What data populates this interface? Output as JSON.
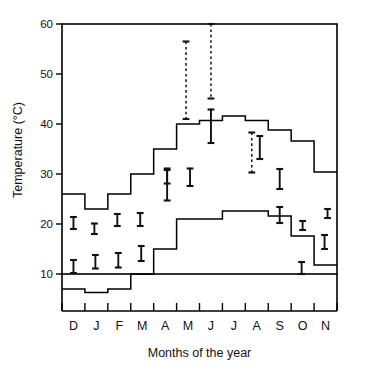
{
  "chart_data": {
    "type": "line",
    "title": "",
    "xlabel": "Months of the year",
    "ylabel": "Temperature (°C)",
    "xlim": [
      0,
      12
    ],
    "ylim": [
      0,
      60
    ],
    "ytick_values": [
      10,
      20,
      30,
      40,
      50,
      60
    ],
    "ytick_labels": [
      "10",
      "20",
      "30",
      "40",
      "50",
      "60"
    ],
    "categories": [
      "D",
      "J",
      "F",
      "M",
      "A",
      "M",
      "J",
      "J",
      "A",
      "S",
      "O",
      "N"
    ],
    "grid": false,
    "legend": false,
    "series": [
      {
        "name": "Maximum temperature (step)",
        "type": "step",
        "values": [
          26.0,
          23.0,
          26.0,
          30.0,
          35.0,
          40.0,
          40.7,
          41.6,
          40.7,
          38.8,
          36.6,
          30.4
        ]
      },
      {
        "name": "Minimum temperature (step)",
        "type": "step",
        "values": [
          7.0,
          6.3,
          7.0,
          10.0,
          15.0,
          21.0,
          21.0,
          22.6,
          22.6,
          21.6,
          17.6,
          11.8
        ]
      }
    ],
    "error_bars_solid": [
      {
        "month": "D",
        "x_index": 0,
        "low": 19.0,
        "high": 21.4
      },
      {
        "month": "D",
        "x_index": 0,
        "low": 10.2,
        "high": 12.8
      },
      {
        "month": "J",
        "x_index": 1,
        "low": 18.0,
        "high": 20.1
      },
      {
        "month": "F",
        "x_index": 2,
        "low": 19.6,
        "high": 22.0
      },
      {
        "month": "M",
        "x_index": 3,
        "low": 19.6,
        "high": 22.2
      },
      {
        "month": "A",
        "x_index": 4,
        "low": 28.1,
        "high": 31.1
      },
      {
        "month": "M",
        "x_index": 5,
        "low": 27.6,
        "high": 31.1
      },
      {
        "month": "J",
        "x_index": 6,
        "low": 36.2,
        "high": 42.9
      },
      {
        "month": "A",
        "x_index": 8,
        "low": 33.0,
        "high": 37.6
      },
      {
        "month": "S",
        "x_index": 9,
        "low": 27.0,
        "high": 31.0
      },
      {
        "month": "S",
        "x_index": 9,
        "low": 20.2,
        "high": 23.4
      },
      {
        "month": "O",
        "x_index": 10,
        "low": 18.8,
        "high": 20.6
      },
      {
        "month": "N",
        "x_index": 11,
        "low": 21.2,
        "high": 23.0
      }
    ],
    "error_bars_dashed": [
      {
        "month": "M",
        "x_index": 5,
        "low": 41.0,
        "high": 56.5
      },
      {
        "month": "J",
        "x_index": 6,
        "low": 45.1,
        "high": 60.0
      },
      {
        "month": "A",
        "x_index": 8,
        "low": 30.3,
        "high": 38.3
      }
    ],
    "error_bars_small_solid": [
      {
        "month": "J",
        "x_index": 1,
        "low": 11.1,
        "high": 13.8
      },
      {
        "month": "F",
        "x_index": 2,
        "low": 11.3,
        "high": 14.2
      },
      {
        "month": "M",
        "x_index": 3,
        "low": 12.6,
        "high": 15.6
      },
      {
        "month": "A",
        "x_index": 4,
        "low": 24.7,
        "high": 30.8
      },
      {
        "month": "O",
        "x_index": 10,
        "low": 9.8,
        "high": 12.4
      },
      {
        "month": "N",
        "x_index": 11,
        "low": 15.0,
        "high": 17.8
      }
    ]
  },
  "axes": {
    "y_title": "Temperature (°C)",
    "x_title": "Months of the year",
    "y_ticks": [
      "60",
      "50",
      "40",
      "30",
      "20",
      "10"
    ],
    "x_ticks": [
      "D",
      "J",
      "F",
      "M",
      "A",
      "M",
      "J",
      "J",
      "A",
      "S",
      "O",
      "N"
    ]
  }
}
